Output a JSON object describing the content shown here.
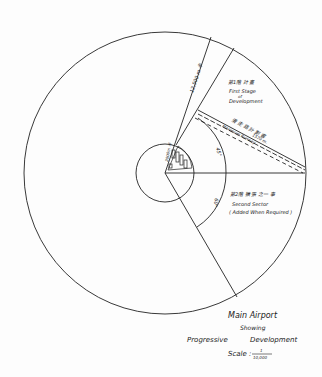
{
  "diagram": {
    "type": "site-plan",
    "stroke_color": "#222222",
    "background": "#fdfdfd",
    "labels": {
      "radius_dim": "12,500 m 半",
      "first_stage_cjk": "第1階 計 畫",
      "first_stage_line1": "First Stage",
      "first_stage_line2": "of",
      "first_stage_line3": "Development",
      "runway_cjk": "滑 走 路 計 劃 書",
      "runway_en": "Maximum Runway",
      "runway_len": "1570 m.",
      "angle_upper": "45°",
      "angle_lower": "60°",
      "inner_radius": "2000m 半",
      "second_sector_cjk": "第2階 擴 張 之一 事",
      "second_sector_line1": "Second  Sector",
      "second_sector_line2": "( Added When Required )"
    },
    "title": {
      "line1": "Main   Airport",
      "line2": "Showing",
      "line3a": "Progressive",
      "line3b": "Development",
      "scale_label": "Scale :",
      "scale_num": "1",
      "scale_den": "10,000"
    }
  }
}
